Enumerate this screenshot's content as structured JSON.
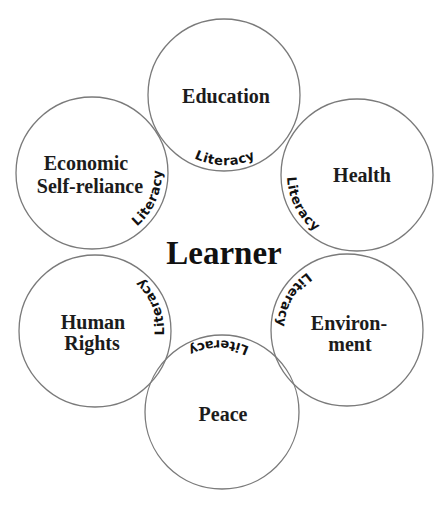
{
  "diagram": {
    "center_label": "Learner",
    "link_label": "Literacy",
    "colors": {
      "stroke": "#7a7a7a",
      "text": "#1c1c1c",
      "background": "#ffffff"
    },
    "nodes": [
      {
        "id": "education",
        "lines": [
          "Education"
        ],
        "cx": 224,
        "cy": 95,
        "r": 76
      },
      {
        "id": "health",
        "lines": [
          "Health"
        ],
        "cx": 357,
        "cy": 175,
        "r": 76
      },
      {
        "id": "environment",
        "lines": [
          "Environ-",
          "ment"
        ],
        "cx": 347,
        "cy": 330,
        "r": 76
      },
      {
        "id": "peace",
        "lines": [
          "Peace"
        ],
        "cx": 222,
        "cy": 412,
        "r": 77
      },
      {
        "id": "human-rights",
        "lines": [
          "Human",
          "Rights"
        ],
        "cx": 95,
        "cy": 331,
        "r": 76
      },
      {
        "id": "economic",
        "lines": [
          "Economic",
          "Self-reliance"
        ],
        "cx": 92,
        "cy": 173,
        "r": 76
      }
    ],
    "literacy_labels": [
      {
        "node": "education",
        "text": "Literacy"
      },
      {
        "node": "health",
        "text": "Literacy"
      },
      {
        "node": "environment",
        "text": "Literacy"
      },
      {
        "node": "peace",
        "text": "Literacy"
      },
      {
        "node": "human-rights",
        "text": "Literacy"
      },
      {
        "node": "economic",
        "text": "Literacy"
      }
    ]
  }
}
